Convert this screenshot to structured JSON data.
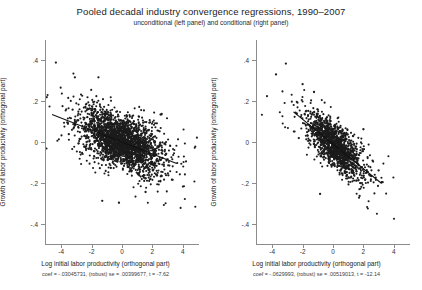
{
  "figure": {
    "title": "Pooled decadal industry convergence regressions, 1990–2007",
    "subtitle": "unconditional (left panel) and conditional (right panel)"
  },
  "chart_data": [
    {
      "type": "scatter",
      "panel": "left",
      "panel_name": "unconditional",
      "title": "Pooled decadal industry convergence regressions, 1990–2007",
      "subtitle": "unconditional (left panel) and conditional (right panel)",
      "xlabel": "Log initial labor productivity (orthogonal part)",
      "ylabel": "Growth of labor productivity (orthogonal part)",
      "xticks": [
        -4,
        -2,
        0,
        2,
        4
      ],
      "xticklabels": [
        "-4",
        "-2",
        "0",
        "2",
        "4"
      ],
      "yticks": [
        0.4,
        0.2,
        0,
        -0.2,
        -0.4
      ],
      "yticklabels": [
        ".4",
        ".2",
        "0",
        "-.2",
        "-.4"
      ],
      "xlim": [
        -5,
        5
      ],
      "ylim": [
        -0.5,
        0.5
      ],
      "grid": false,
      "legend": "none",
      "marker_color": "#1c1c1c",
      "fit_color": "#111111",
      "n_points": 2600,
      "fit": {
        "slope": -0.03045731,
        "intercept": 0.0,
        "x_start": -4.6,
        "x_end": 3.6
      },
      "annotation": "coef = -.03045731, (robust) se = .00399677, t = -7.62",
      "stats": {
        "coef_label": "coef",
        "coef": "-.03045731",
        "se_label": "(robust) se",
        "se": ".00399677",
        "t_label": "t",
        "t": "-7.62"
      }
    },
    {
      "type": "scatter",
      "panel": "right",
      "panel_name": "conditional",
      "title": "Pooled decadal industry convergence regressions, 1990–2007",
      "subtitle": "unconditional (left panel) and conditional (right panel)",
      "xlabel": "Log initial labor productivity (orthogonal part)",
      "ylabel": "Growth of labor productivity (orthogonal part)",
      "xticks": [
        -4,
        -2,
        0,
        2,
        4
      ],
      "xticklabels": [
        "-4",
        "-2",
        "0",
        "2",
        "4"
      ],
      "yticks": [
        0.4,
        0.2,
        0,
        -0.2,
        -0.4
      ],
      "yticklabels": [
        ".4",
        ".2",
        "0",
        "-.2",
        "-.4"
      ],
      "xlim": [
        -5,
        5
      ],
      "ylim": [
        -0.5,
        0.5
      ],
      "grid": false,
      "legend": "none",
      "marker_color": "#1c1c1c",
      "fit_color": "#111111",
      "n_points": 1500,
      "fit": {
        "slope": -0.0629993,
        "intercept": -0.01,
        "x_start": -2.6,
        "x_end": 3.2
      },
      "annotation": "coef = -.0629993, (robust) se = .00519013, t = -12.14",
      "stats": {
        "coef_label": "coef",
        "coef": "-.0629993",
        "se_label": "(robust) se",
        "se": ".00519013",
        "t_label": "t",
        "t": "-12.14"
      }
    }
  ]
}
